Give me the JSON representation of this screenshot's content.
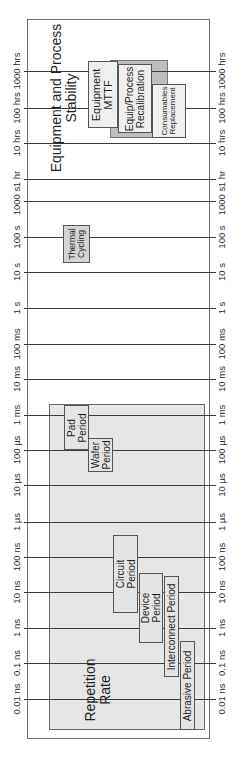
{
  "diagram": {
    "orientation": "rotated-90-ccw",
    "axis_ticks": [
      {
        "label": "1000 hrs",
        "y": 71
      },
      {
        "label": "100 hrs",
        "y": 108
      },
      {
        "label": "10 hrs",
        "y": 143
      },
      {
        "label": "1 hr",
        "y": 179
      },
      {
        "label": "1000 s",
        "y": 201
      },
      {
        "label": "100 s",
        "y": 237
      },
      {
        "label": "10 s",
        "y": 272
      },
      {
        "label": "1 s",
        "y": 308
      },
      {
        "label": "100 ms",
        "y": 344
      },
      {
        "label": "10 ms",
        "y": 379
      },
      {
        "label": "1 ms",
        "y": 415
      },
      {
        "label": "100 µs",
        "y": 450
      },
      {
        "label": "10 µs",
        "y": 485
      },
      {
        "label": "1 µs",
        "y": 522
      },
      {
        "label": "100 ns",
        "y": 557
      },
      {
        "label": "10 ns",
        "y": 592
      },
      {
        "label": "1 ns",
        "y": 628
      },
      {
        "label": "0.1 ns",
        "y": 663
      },
      {
        "label": "0.01 ns",
        "y": 699
      }
    ],
    "regions": {
      "stability": {
        "title_line1": "Equipment and Process",
        "title_line2": "Stability"
      },
      "repetition": {
        "title_line1": "Repetition",
        "title_line2": "Rate"
      }
    },
    "boxes": {
      "equipment_mttf": {
        "line1": "Equipment",
        "line2": "MTTF"
      },
      "recalibration": {
        "line1": "Equip/Process",
        "line2": "Recalibration"
      },
      "consumables": {
        "line1": "Consumables",
        "line2": "Replacement"
      },
      "thermal_cycling": {
        "line1": "Thermal",
        "line2": "Cycling"
      },
      "pad_period": {
        "line1": "Pad",
        "line2": "Period"
      },
      "wafer_period": {
        "line1": "Wafer",
        "line2": "Period"
      },
      "circuit_period": {
        "line1": "Circuit",
        "line2": "Period"
      },
      "device_period": {
        "line1": "Device",
        "line2": "Period"
      },
      "interconnect_period": {
        "line1": "Interconnect Period"
      },
      "abrasive_period": {
        "line1": "Abrasive Period"
      }
    },
    "colors": {
      "frame": "#6a6a6a",
      "grid": "#3a3a3a",
      "box_fill": "#e4e4e4",
      "dark_fill": "#bdbdbd"
    }
  }
}
